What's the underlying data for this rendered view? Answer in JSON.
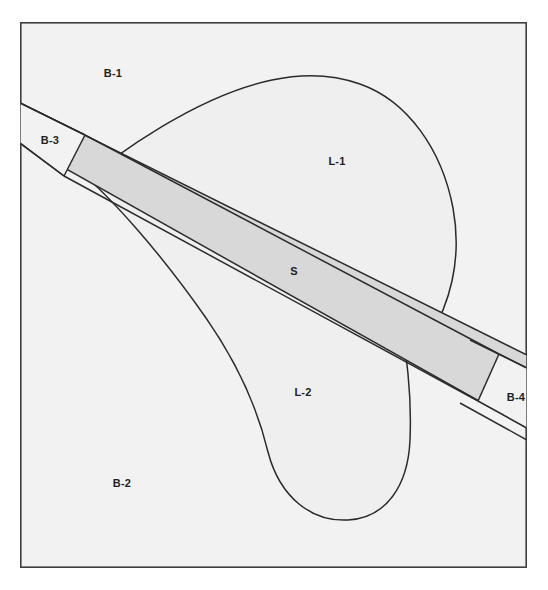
{
  "figure": {
    "type": "geometric-region-diagram",
    "canvas": {
      "width": 548,
      "height": 590
    },
    "frame": {
      "x": 20,
      "y": 22,
      "width": 507,
      "height": 546,
      "fill": "#f2f2f2",
      "stroke": "#3f3f3f",
      "stroke_width": 1.6
    },
    "colors": {
      "background_fill": "#f2f2f2",
      "lobe_fill": "#efefef",
      "band_fill": "#d8d8d8",
      "outline": "#2b2b2b",
      "frame_outline": "#3f3f3f",
      "label_color": "#231f20"
    },
    "regions": [
      {
        "id": "B-1",
        "label": "B-1",
        "kind": "background-block",
        "label_x": 113,
        "label_y": 74,
        "description": "Upper-left background region above the band and outside lobe L-1"
      },
      {
        "id": "B-2",
        "label": "B-2",
        "kind": "background-block",
        "label_x": 122,
        "label_y": 484,
        "description": "Lower-left background region below the band and outside lobe L-2"
      },
      {
        "id": "B-3",
        "label": "B-3",
        "kind": "background-block",
        "label_x": 50,
        "label_y": 141,
        "description": "Small wedge region at the left edge where the band enters the frame"
      },
      {
        "id": "B-4",
        "label": "B-4",
        "kind": "background-block",
        "label_x": 516,
        "label_y": 398,
        "description": "Small wedge region at the right edge where the band exits the frame"
      },
      {
        "id": "L-1",
        "label": "L-1",
        "kind": "lobe",
        "label_x": 337,
        "label_y": 162,
        "description": "Upper lobe truncated below by the diagonal band"
      },
      {
        "id": "L-2",
        "label": "L-2",
        "kind": "lobe",
        "label_x": 303,
        "label_y": 393,
        "description": "Lower lobe truncated above by the diagonal band"
      },
      {
        "id": "S",
        "label": "S",
        "kind": "band",
        "label_x": 294,
        "label_y": 272,
        "description": "Shaded diagonal band crossing the frame from upper-left to lower-right"
      }
    ],
    "geometry": {
      "band_upper_edge": {
        "x1": 20,
        "y1": 103,
        "x2": 527,
        "y2": 355
      },
      "band_lower_edge": {
        "x1": 20,
        "y1": 143,
        "x2": 527,
        "y2": 428
      },
      "b3_cut_line": {
        "x1": 85,
        "y1": 144,
        "x2": 64,
        "y2": 176
      },
      "b4_cut_line": {
        "x1": 499,
        "y1": 354,
        "x2": 519,
        "y2": 410
      },
      "lobe_l1_apex": {
        "x": 318,
        "y": 77
      },
      "lobe_l1_right_extreme": {
        "x": 455,
        "y": 245
      },
      "lobe_l2_bottom": {
        "x": 330,
        "y": 520
      },
      "lobe_l2_left_tip": {
        "x": 82,
        "y": 182
      }
    }
  }
}
